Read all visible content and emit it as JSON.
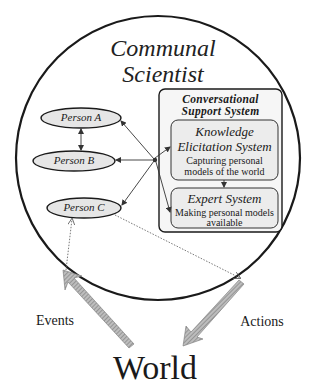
{
  "diagram": {
    "title_line1": "Communal",
    "title_line2": "Scientist",
    "persons": [
      {
        "label": "Person A"
      },
      {
        "label": "Person B"
      },
      {
        "label": "Person C"
      }
    ],
    "support_system": {
      "title_line1": "Conversational",
      "title_line2": "Support System",
      "knowledge": {
        "title_line1": "Knowledge",
        "title_line2": "Elicitation System",
        "desc_line1": "Capturing personal",
        "desc_line2": "models of the world"
      },
      "expert": {
        "title": "Expert System",
        "desc_line1": "Making personal models",
        "desc_line2": "available"
      }
    },
    "events_label": "Events",
    "actions_label": "Actions",
    "world_label": "World",
    "colors": {
      "outline": "#1a1a1a",
      "ellipse_fill": "#e6e6e6",
      "box_fill": "#f3f3f3",
      "inner_box_fill": "#ececec",
      "big_arrow": "#9a9a9a"
    }
  }
}
